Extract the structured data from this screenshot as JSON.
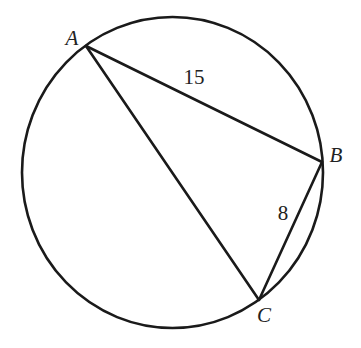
{
  "diagram": {
    "type": "inscribed-triangle-in-circle",
    "stroke_color": "#1a1a1a",
    "background": "#ffffff",
    "circle": {
      "cx": 172.5,
      "cy": 172.5,
      "rx": 150.5,
      "ry": 155.5
    },
    "points": {
      "A": {
        "label": "A",
        "x": 86,
        "y": 46,
        "label_x": 72,
        "label_y": 38
      },
      "B": {
        "label": "B",
        "x": 322,
        "y": 162,
        "label_x": 336,
        "label_y": 155
      },
      "C": {
        "label": "C",
        "x": 259,
        "y": 300,
        "label_x": 264,
        "label_y": 315
      }
    },
    "segments": [
      {
        "from": "A",
        "to": "B",
        "length_label": "15",
        "label_x": 194,
        "label_y": 77
      },
      {
        "from": "B",
        "to": "C",
        "length_label": "8",
        "label_x": 283,
        "label_y": 213
      },
      {
        "from": "A",
        "to": "C",
        "length_label": ""
      }
    ]
  }
}
